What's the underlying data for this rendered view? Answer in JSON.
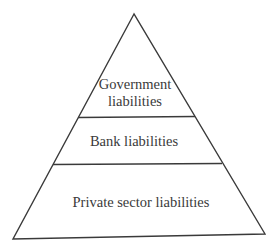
{
  "diagram": {
    "type": "pyramid",
    "colors": {
      "stroke": "#3a3a3a",
      "background": "#ffffff",
      "text": "#3a3a3a"
    },
    "levels": [
      {
        "position": "top",
        "line1": "Government",
        "line2": "liabilities"
      },
      {
        "position": "middle",
        "label": "Bank liabilities"
      },
      {
        "position": "bottom",
        "label": "Private sector liabilities"
      }
    ]
  }
}
